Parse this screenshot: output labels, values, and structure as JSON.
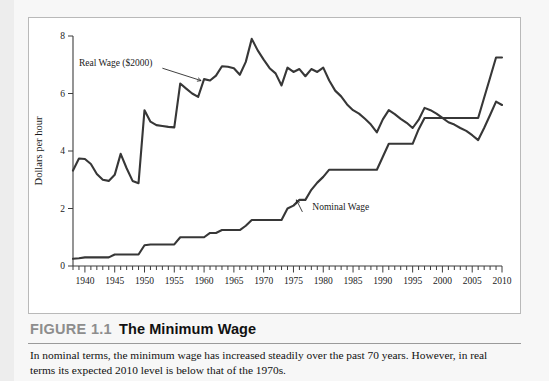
{
  "figure": {
    "number_label": "FIGURE 1.1",
    "title": "The Minimum Wage",
    "caption": "In nominal terms, the minimum wage has increased steadily over the past 70 years. However, in real terms its expected 2010 level is below that of the 1970s."
  },
  "chart_data": {
    "type": "line",
    "title": "The Minimum Wage",
    "xlabel": "",
    "ylabel": "Dollars per hour",
    "xlim": [
      1938,
      2010
    ],
    "ylim": [
      0,
      8
    ],
    "grid": false,
    "legend_position": "inline-annotations",
    "x_tick_labels": [
      "1940",
      "1945",
      "1950",
      "1955",
      "1960",
      "1965",
      "1970",
      "1975",
      "1980",
      "1985",
      "1990",
      "1995",
      "2000",
      "2005",
      "2010"
    ],
    "x_tick_values": [
      1940,
      1945,
      1950,
      1955,
      1960,
      1965,
      1970,
      1975,
      1980,
      1985,
      1990,
      1995,
      2000,
      2005,
      2010
    ],
    "x_minor_tick_interval": 1,
    "y_tick_labels": [
      "0",
      "2",
      "4",
      "6",
      "8"
    ],
    "y_tick_values": [
      0,
      2,
      4,
      6,
      8
    ],
    "annotations": [
      {
        "text": "Real Wage ($2000)",
        "x": 1952,
        "y": 6.95,
        "points_to_x": 1959.5,
        "points_to_y": 6.45
      },
      {
        "text": "Nominal Wage",
        "x": 1977.5,
        "y": 1.95,
        "points_to_x": 1975.5,
        "points_to_y": 2.3
      }
    ],
    "x": [
      1938,
      1939,
      1940,
      1941,
      1942,
      1943,
      1944,
      1945,
      1946,
      1947,
      1948,
      1949,
      1950,
      1951,
      1952,
      1953,
      1954,
      1955,
      1956,
      1957,
      1958,
      1959,
      1960,
      1961,
      1962,
      1963,
      1964,
      1965,
      1966,
      1967,
      1968,
      1969,
      1970,
      1971,
      1972,
      1973,
      1974,
      1975,
      1976,
      1977,
      1978,
      1979,
      1980,
      1981,
      1982,
      1983,
      1984,
      1985,
      1986,
      1987,
      1988,
      1989,
      1990,
      1991,
      1992,
      1993,
      1994,
      1995,
      1996,
      1997,
      1998,
      1999,
      2000,
      2001,
      2002,
      2003,
      2004,
      2005,
      2006,
      2007,
      2008,
      2009,
      2010
    ],
    "series": [
      {
        "name": "Real Wage ($2000)",
        "values": [
          3.32,
          3.74,
          3.72,
          3.55,
          3.2,
          3.0,
          2.96,
          3.17,
          3.9,
          3.4,
          2.96,
          2.88,
          5.42,
          5.02,
          4.9,
          4.87,
          4.84,
          4.82,
          6.35,
          6.17,
          6.0,
          5.88,
          6.5,
          6.45,
          6.62,
          6.95,
          6.93,
          6.88,
          6.65,
          7.1,
          7.9,
          7.5,
          7.18,
          6.88,
          6.7,
          6.28,
          6.9,
          6.75,
          6.85,
          6.6,
          6.85,
          6.75,
          6.9,
          6.45,
          6.1,
          5.9,
          5.62,
          5.42,
          5.3,
          5.12,
          4.92,
          4.65,
          5.1,
          5.42,
          5.28,
          5.12,
          4.98,
          4.8,
          5.08,
          5.5,
          5.42,
          5.3,
          5.15,
          5.0,
          4.92,
          4.8,
          4.7,
          4.55,
          4.38,
          4.8,
          5.25,
          5.72,
          5.6
        ]
      },
      {
        "name": "Nominal Wage",
        "values": [
          0.25,
          0.27,
          0.3,
          0.3,
          0.3,
          0.3,
          0.3,
          0.4,
          0.4,
          0.4,
          0.4,
          0.4,
          0.72,
          0.75,
          0.75,
          0.75,
          0.75,
          0.75,
          1.0,
          1.0,
          1.0,
          1.0,
          1.0,
          1.15,
          1.15,
          1.25,
          1.25,
          1.25,
          1.25,
          1.4,
          1.6,
          1.6,
          1.6,
          1.6,
          1.6,
          1.6,
          2.0,
          2.1,
          2.3,
          2.3,
          2.65,
          2.9,
          3.1,
          3.35,
          3.35,
          3.35,
          3.35,
          3.35,
          3.35,
          3.35,
          3.35,
          3.35,
          3.8,
          4.25,
          4.25,
          4.25,
          4.25,
          4.25,
          4.75,
          5.15,
          5.15,
          5.15,
          5.15,
          5.15,
          5.15,
          5.15,
          5.15,
          5.15,
          5.15,
          5.85,
          6.55,
          7.25,
          7.25
        ]
      }
    ]
  }
}
